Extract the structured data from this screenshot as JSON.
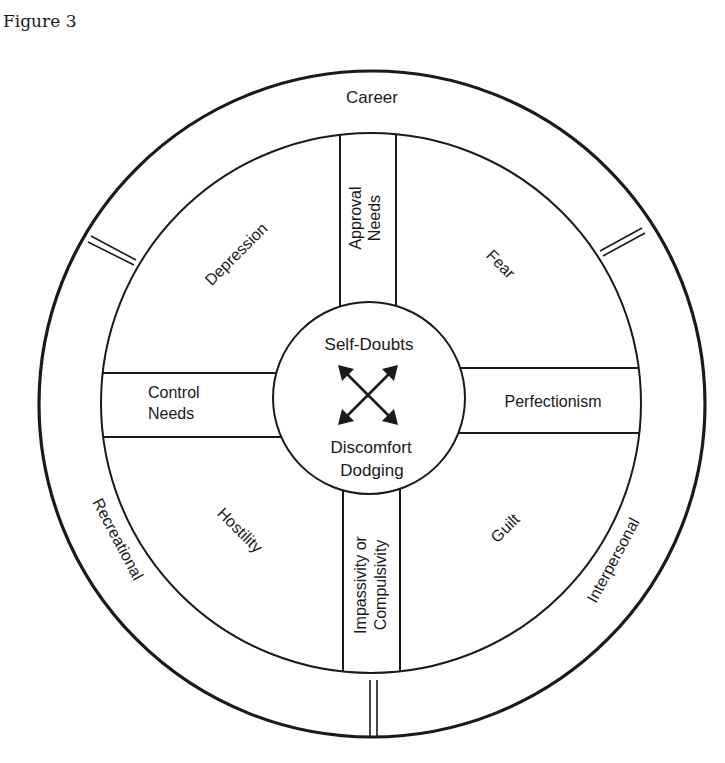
{
  "figure": {
    "label": "Figure 3"
  },
  "outer_ring": {
    "labels": {
      "top": "Career",
      "bottom_left": "Recreational",
      "bottom_right": "Interpersonal"
    }
  },
  "quadrants": {
    "top_left": "Depression",
    "top_right": "Fear",
    "bottom_left": "Hostility",
    "bottom_right": "Guilt"
  },
  "bands": {
    "top": [
      "Approval",
      "Needs"
    ],
    "left": [
      "Control",
      "Needs"
    ],
    "right": [
      "Perfectionism"
    ],
    "bottom": [
      "Impassivity or",
      "Compulsivity"
    ]
  },
  "center": {
    "top": "Self-Doubts",
    "bottom": [
      "Discomfort",
      "Dodging"
    ],
    "icon": "four-way-arrows-icon"
  },
  "colors": {
    "ink": "#1a1a1a",
    "background": "#ffffff"
  }
}
